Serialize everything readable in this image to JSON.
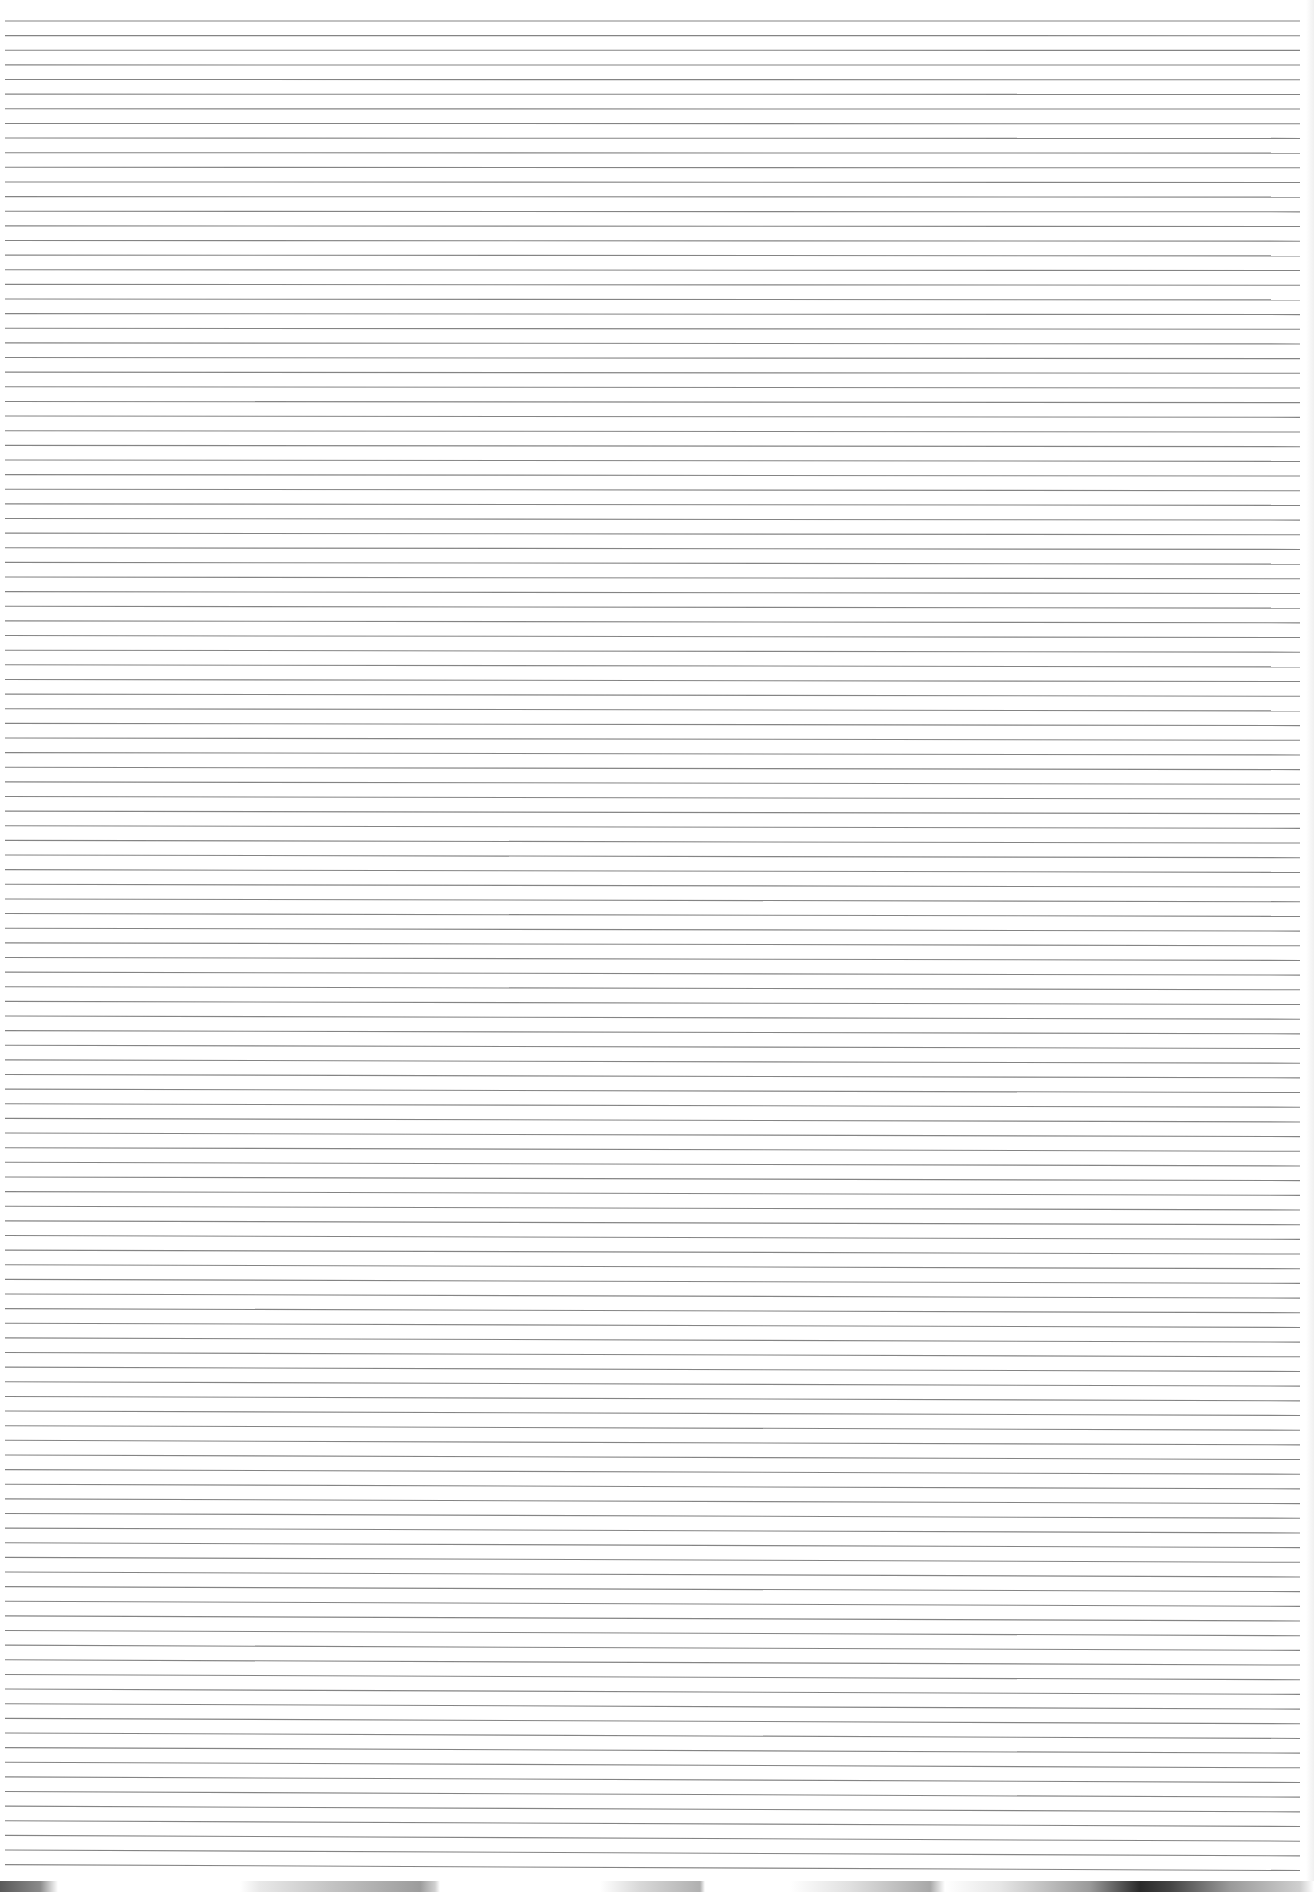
{
  "document": {
    "type": "ruled-paper-scan",
    "text": "",
    "rules": {
      "count": 128,
      "first_y": 21,
      "spacing": 14.64,
      "left_x": 5,
      "right_x": 1300,
      "tilt_px": 5,
      "color": "#6e6e6e"
    },
    "background": "#ffffff",
    "scanner_edge": {
      "top_y": 1881,
      "colors": [
        "#5a5a5a",
        "#9c9c9c",
        "#2a2a2a"
      ]
    }
  }
}
